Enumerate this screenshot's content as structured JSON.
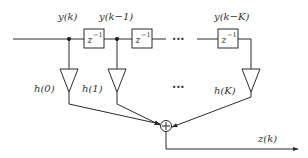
{
  "diagram": {
    "signal_labels": {
      "y0": "y(k)",
      "y1": "y(k−1)",
      "yK": "y(k−K)",
      "output": "z(k)"
    },
    "delay_label": {
      "base": "z",
      "exponent": "−1"
    },
    "gain_labels": {
      "h0": "h(0)",
      "h1": "h(1)",
      "hK": "h(K)"
    },
    "ellipsis": "···",
    "sum_symbol": "+"
  }
}
